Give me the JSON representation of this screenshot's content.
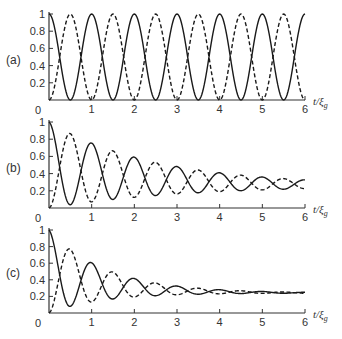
{
  "chart_data": [
    {
      "type": "line",
      "panel_label": "(a)",
      "xlabel": "t/ξg",
      "x_ticks": [
        "0",
        "1",
        "2",
        "3",
        "4",
        "5",
        "6"
      ],
      "y_ticks": [
        "0",
        "0.2",
        "0.4",
        "0.6",
        "0.8",
        "1"
      ],
      "xlim": [
        0,
        6
      ],
      "ylim": [
        0,
        1
      ],
      "series": [
        {
          "name": "solid",
          "style": "solid",
          "model": {
            "mean0": 0.5,
            "mean_inf": 0.5,
            "mean_decay": 0,
            "amp0": 0.5,
            "amp_decay": 0,
            "sign": 1
          },
          "maxima": [
            [
              0,
              1
            ],
            [
              1,
              1
            ],
            [
              2,
              1
            ],
            [
              3,
              1
            ],
            [
              4,
              1
            ],
            [
              5,
              1
            ],
            [
              6,
              1
            ]
          ],
          "minima": [
            [
              0.5,
              0
            ],
            [
              1.5,
              0
            ],
            [
              2.5,
              0
            ],
            [
              3.5,
              0
            ],
            [
              4.5,
              0
            ],
            [
              5.5,
              0
            ]
          ]
        },
        {
          "name": "dashed",
          "style": "dashed",
          "model": {
            "mean0": 0.5,
            "mean_inf": 0.5,
            "mean_decay": 0,
            "amp0": 0.5,
            "amp_decay": 0,
            "sign": -1
          },
          "maxima": [
            [
              0.5,
              1
            ],
            [
              1.5,
              1
            ],
            [
              2.5,
              1
            ],
            [
              3.5,
              1
            ],
            [
              4.5,
              1
            ],
            [
              5.5,
              1
            ]
          ],
          "minima": [
            [
              0,
              0
            ],
            [
              1,
              0
            ],
            [
              2,
              0
            ],
            [
              3,
              0
            ],
            [
              4,
              0
            ],
            [
              5,
              0
            ],
            [
              6,
              0
            ]
          ]
        }
      ]
    },
    {
      "type": "line",
      "panel_label": "(b)",
      "xlabel": "t/ξg",
      "x_ticks": [
        "0",
        "1",
        "2",
        "3",
        "4",
        "5",
        "6"
      ],
      "y_ticks": [
        "0",
        "0.2",
        "0.4",
        "0.6",
        "0.8",
        "1"
      ],
      "xlim": [
        0,
        6
      ],
      "ylim": [
        0,
        1
      ],
      "series": [
        {
          "name": "solid",
          "style": "solid",
          "model": {
            "mean0": 0.5,
            "mean_inf": 0.26,
            "mean_decay": 0.45,
            "amp0": 0.5,
            "amp_decay": 0.38,
            "sign": 1
          },
          "maxima": [
            [
              0,
              1
            ],
            [
              1,
              0.73
            ],
            [
              2,
              0.58
            ],
            [
              3,
              0.47
            ],
            [
              4,
              0.4
            ],
            [
              5,
              0.36
            ],
            [
              6,
              0.33
            ]
          ],
          "minima": [
            [
              0.5,
              0
            ],
            [
              1.5,
              0.05
            ],
            [
              2.5,
              0.1
            ],
            [
              3.5,
              0.14
            ],
            [
              4.5,
              0.17
            ],
            [
              5.5,
              0.19
            ]
          ]
        },
        {
          "name": "dashed",
          "style": "dashed",
          "model": {
            "mean0": 0.5,
            "mean_inf": 0.26,
            "mean_decay": 0.45,
            "amp0": 0.5,
            "amp_decay": 0.38,
            "sign": -1
          },
          "maxima": [
            [
              0.5,
              0.85
            ],
            [
              1.5,
              0.66
            ],
            [
              2.5,
              0.52
            ],
            [
              3.5,
              0.44
            ],
            [
              4.5,
              0.38
            ],
            [
              5.5,
              0.35
            ]
          ],
          "minima": [
            [
              0,
              0
            ],
            [
              1,
              0.05
            ],
            [
              2,
              0.09
            ],
            [
              3,
              0.13
            ],
            [
              4,
              0.16
            ],
            [
              5,
              0.18
            ],
            [
              6,
              0.2
            ]
          ]
        }
      ]
    },
    {
      "type": "line",
      "panel_label": "(c)",
      "xlabel": "t/ξg",
      "x_ticks": [
        "0",
        "1",
        "2",
        "3",
        "4",
        "5",
        "6"
      ],
      "y_ticks": [
        "0",
        "0.2",
        "0.4",
        "0.6",
        "0.8",
        "1"
      ],
      "xlim": [
        0,
        6
      ],
      "ylim": [
        0,
        1
      ],
      "series": [
        {
          "name": "solid",
          "style": "solid",
          "model": {
            "mean0": 0.5,
            "mean_inf": 0.24,
            "mean_decay": 0.7,
            "amp0": 0.5,
            "amp_decay": 0.75,
            "sign": 1
          },
          "maxima": [
            [
              0,
              1
            ],
            [
              1,
              0.58
            ],
            [
              2,
              0.4
            ],
            [
              3,
              0.31
            ],
            [
              4,
              0.27
            ],
            [
              5,
              0.25
            ],
            [
              6,
              0.25
            ]
          ],
          "minima": [
            [
              0.5,
              0.02
            ],
            [
              1.5,
              0.1
            ],
            [
              2.5,
              0.16
            ],
            [
              3.5,
              0.2
            ],
            [
              4.5,
              0.22
            ],
            [
              5.5,
              0.23
            ]
          ]
        },
        {
          "name": "dashed",
          "style": "dashed",
          "model": {
            "mean0": 0.5,
            "mean_inf": 0.24,
            "mean_decay": 0.7,
            "amp0": 0.5,
            "amp_decay": 0.75,
            "sign": -1
          },
          "maxima": [
            [
              0.5,
              0.75
            ],
            [
              1.5,
              0.47
            ],
            [
              2.5,
              0.35
            ],
            [
              3.5,
              0.29
            ],
            [
              4.5,
              0.26
            ],
            [
              5.5,
              0.25
            ]
          ],
          "minima": [
            [
              0,
              0
            ],
            [
              1,
              0.06
            ],
            [
              2,
              0.13
            ],
            [
              3,
              0.18
            ],
            [
              4,
              0.21
            ],
            [
              5,
              0.22
            ],
            [
              6,
              0.23
            ]
          ]
        }
      ]
    }
  ],
  "panels": [
    {
      "label": "(a)",
      "xlabel_t": "t/ξ",
      "xlabel_sub": "g"
    },
    {
      "label": "(b)",
      "xlabel_t": "t/ξ",
      "xlabel_sub": "g"
    },
    {
      "label": "(c)",
      "xlabel_t": "t/ξ",
      "xlabel_sub": "g"
    }
  ],
  "colors": {
    "line": "#1a1a1a",
    "axis": "#333333",
    "background": "#ffffff"
  }
}
